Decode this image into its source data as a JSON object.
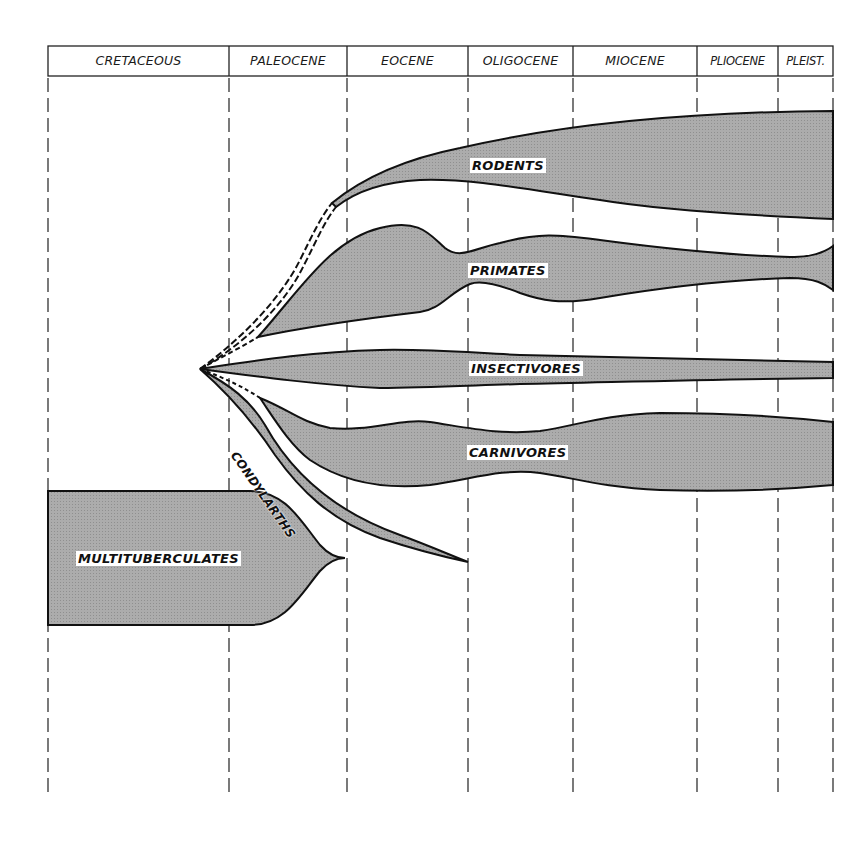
{
  "diagram": {
    "type": "evolutionary-spindle-diagram",
    "colors": {
      "fill": "#a9a9a9",
      "stroke": "#111111",
      "grid": "#222222",
      "background": "#ffffff"
    },
    "periods": [
      {
        "label": "CRETACEOUS",
        "x0": 48,
        "x1": 229
      },
      {
        "label": "PALEOCENE",
        "x0": 229,
        "x1": 347
      },
      {
        "label": "EOCENE",
        "x0": 347,
        "x1": 468
      },
      {
        "label": "OLIGOCENE",
        "x0": 468,
        "x1": 573
      },
      {
        "label": "MIOCENE",
        "x0": 573,
        "x1": 697
      },
      {
        "label": "PLIOCENE",
        "x0": 697,
        "x1": 778
      },
      {
        "label": "PLEIST.",
        "x0": 778,
        "x1": 833
      }
    ],
    "taxa": [
      {
        "label": "RODENTS",
        "x": 470,
        "y": 157
      },
      {
        "label": "PRIMATES",
        "x": 468,
        "y": 263
      },
      {
        "label": "INSECTIVORES",
        "x": 469,
        "y": 361
      },
      {
        "label": "CARNIVORES",
        "x": 467,
        "y": 445
      },
      {
        "label": "CONDYLARTHS",
        "x": 245,
        "y": 450
      },
      {
        "label": "MULTITUBERCULATES",
        "x": 76,
        "y": 551
      }
    ]
  }
}
